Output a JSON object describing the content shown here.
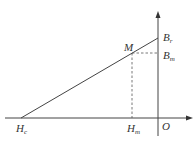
{
  "diagram": {
    "title": "",
    "colors": {
      "line": "#444444",
      "text": "#333333",
      "background": "#ffffff"
    },
    "axes": {
      "x": {
        "direction": "right",
        "origin_label": "O"
      },
      "y": {
        "direction": "up"
      }
    },
    "points": {
      "Hc": {
        "main": "H",
        "sub": "c"
      },
      "Hm": {
        "main": "H",
        "sub": "m"
      },
      "Br": {
        "main": "B",
        "sub": "r"
      },
      "Bm": {
        "main": "B",
        "sub": "m"
      },
      "M": {
        "main": "M",
        "sub": ""
      },
      "O": {
        "main": "O",
        "sub": ""
      }
    },
    "lines": [
      {
        "from": "Hc",
        "to": "Br",
        "style": "solid"
      },
      {
        "from": "M",
        "to": "Hm",
        "style": "dashed"
      },
      {
        "from": "M",
        "to": "Bm",
        "style": "dashed"
      }
    ]
  }
}
